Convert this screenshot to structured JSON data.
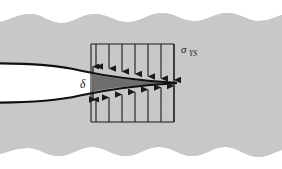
{
  "figure": {
    "kind": "strip-yield-crack-tip-diagram",
    "background_color": "#ffffff",
    "material_color": "#c9c9c9",
    "material_edge_color": "#bdbdbd",
    "plastic_zone_color": "#6e6e6e",
    "crack_face_color": "#111111",
    "crack_interior_color": "#ffffff",
    "line_color": "#1a1a1a",
    "labels": {
      "stress": "σ",
      "stress_subscript": "YS",
      "opening": "δ"
    },
    "icon_names": {
      "down_arrow": "down-arrow-icon",
      "up_arrow": "up-arrow-icon",
      "double_arrow": "double-headed-arrow-icon"
    },
    "loading_box": {
      "left": 91,
      "right": 174,
      "top": 44,
      "bottom": 122
    },
    "down_arrow_x": [
      96,
      109,
      122,
      135,
      148,
      161,
      174
    ],
    "up_arrow_x": [
      96,
      109,
      122,
      135,
      148,
      161,
      174
    ],
    "arrow_count_top": 7,
    "arrow_count_bottom": 7,
    "crack_tip_x": 176,
    "crack_tip_y": 83,
    "delta_arrow": {
      "x": 93,
      "y_top": 65,
      "y_bottom": 101
    }
  }
}
